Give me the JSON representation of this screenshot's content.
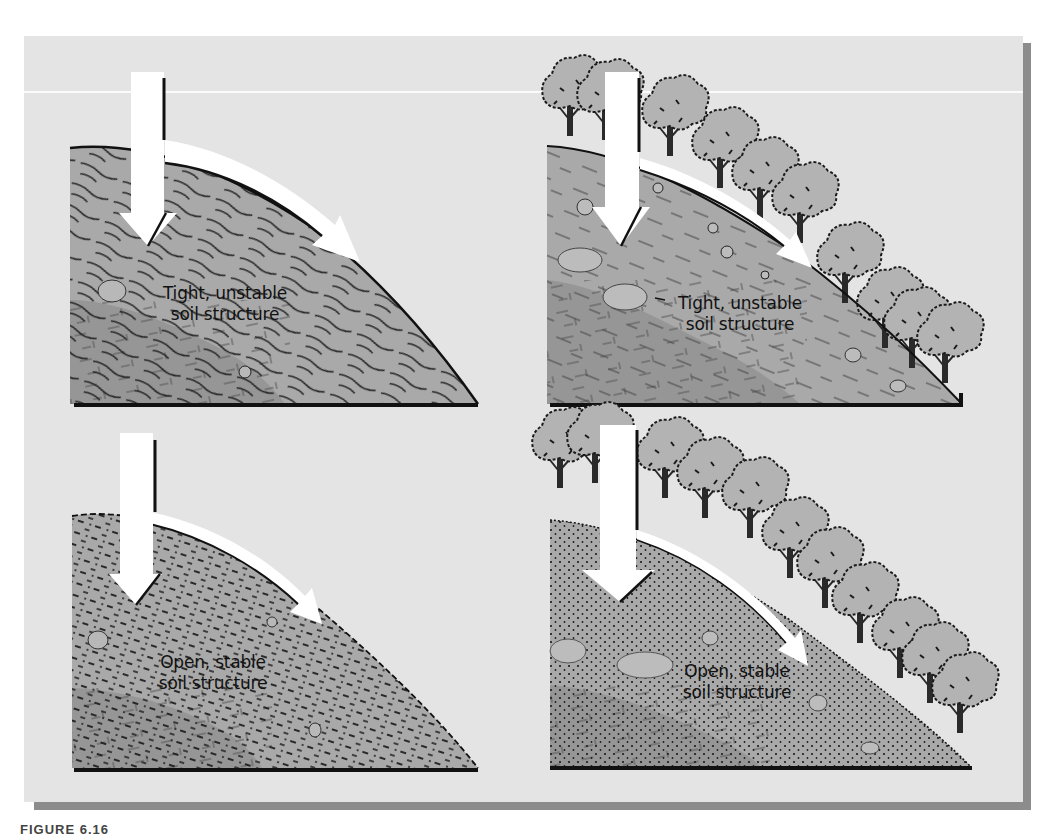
{
  "figure": {
    "caption_label": "FIGURE 6.16",
    "colors": {
      "background": "#e4e4e4",
      "soil": "#a9a9a9",
      "bedrock": "#969696",
      "tree_canopy": "#b3b3b3",
      "arrow": "#ffffff",
      "outline": "#111111",
      "shadow": "#8c8c8c"
    },
    "panels": [
      {
        "id": "top-left",
        "vegetation": "none",
        "soil": "tight",
        "label_line1": "Tight, unstable",
        "label_line2": "soil structure"
      },
      {
        "id": "top-right",
        "vegetation": "trees",
        "soil": "tight",
        "label_line1": "Tight, unstable",
        "label_line2": "soil structure"
      },
      {
        "id": "bottom-left",
        "vegetation": "none",
        "soil": "open",
        "label_line1": "Open, stable",
        "label_line2": "soil structure"
      },
      {
        "id": "bottom-right",
        "vegetation": "trees",
        "soil": "open",
        "label_line1": "Open, stable",
        "label_line2": "soil structure"
      }
    ]
  }
}
